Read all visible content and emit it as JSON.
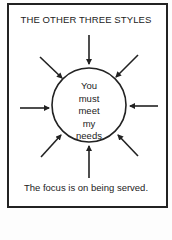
{
  "title": "THE OTHER THREE STYLES",
  "center": {
    "lines": [
      "You",
      "must",
      "meet",
      "my",
      "needs"
    ]
  },
  "caption": "The focus is on being served.",
  "colors": {
    "ink": "#222222",
    "paper": "#ffffff"
  }
}
